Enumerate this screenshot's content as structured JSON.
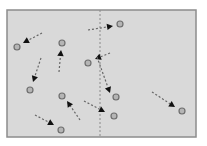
{
  "diagram": {
    "type": "movement-vector-field",
    "frame": {
      "x": 7,
      "y": 10,
      "width": 189,
      "height": 127,
      "fill": "#d9d9d9",
      "stroke": "#8c8c8c"
    },
    "divider": {
      "x": 100,
      "y1": 10,
      "y2": 137,
      "style": "dashed",
      "color": "#8a8a8a"
    },
    "colors": {
      "arrow": "#666666",
      "arrowhead": "#111111",
      "marker_fill": "#b5b5b5",
      "marker_stroke": "#6e6e6e"
    },
    "vectors": [
      {
        "id": "v1",
        "start": [
          42,
          33
        ],
        "head": [
          23,
          43
        ],
        "marker": [
          17,
          47
        ]
      },
      {
        "id": "v2",
        "start": [
          88,
          30
        ],
        "head": [
          113,
          26
        ],
        "marker": [
          120,
          24
        ]
      },
      {
        "id": "v3",
        "start": [
          59,
          72
        ],
        "head": [
          61,
          50
        ],
        "marker": [
          62,
          43
        ]
      },
      {
        "id": "v4",
        "start": [
          110,
          53
        ],
        "head": [
          95,
          59
        ],
        "marker": [
          88,
          63
        ]
      },
      {
        "id": "v5",
        "start": [
          41,
          58
        ],
        "head": [
          33,
          82
        ],
        "marker": [
          30,
          90
        ]
      },
      {
        "id": "v6",
        "start": [
          80,
          120
        ],
        "head": [
          67,
          101
        ],
        "marker": [
          62,
          96
        ]
      },
      {
        "id": "v7",
        "start": [
          35,
          115
        ],
        "head": [
          54,
          125
        ],
        "marker": [
          61,
          130
        ]
      },
      {
        "id": "v8",
        "start": [
          84,
          101
        ],
        "head": [
          105,
          112
        ],
        "marker": [
          114,
          116
        ]
      },
      {
        "id": "v9",
        "start": [
          97,
          57
        ],
        "head": [
          110,
          93
        ],
        "marker": [
          116,
          97
        ]
      },
      {
        "id": "v10",
        "start": [
          152,
          92
        ],
        "head": [
          175,
          107
        ],
        "marker": [
          182,
          111
        ]
      }
    ]
  }
}
